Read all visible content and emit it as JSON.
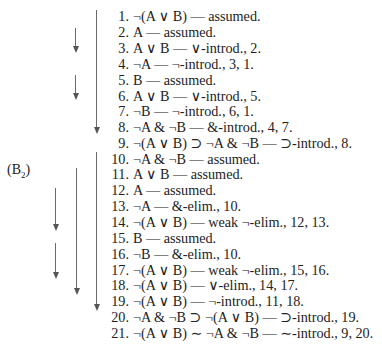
{
  "label": {
    "text": "(B",
    "sub": "2",
    "close": ")"
  },
  "lines": [
    {
      "n": "1.",
      "text": "¬(A ∨ B) — assumed."
    },
    {
      "n": "2.",
      "text": "A — assumed."
    },
    {
      "n": "3.",
      "text": "A ∨ B — ∨-introd., 2."
    },
    {
      "n": "4.",
      "text": "¬A — ¬-introd., 3, 1."
    },
    {
      "n": "5.",
      "text": "B — assumed."
    },
    {
      "n": "6.",
      "text": "A ∨ B — ∨-introd., 5."
    },
    {
      "n": "7.",
      "text": "¬B — ¬-introd., 6, 1."
    },
    {
      "n": "8.",
      "text": "¬A & ¬B — &-introd., 4, 7."
    },
    {
      "n": "9.",
      "text": "¬(A ∨ B) ⊃ ¬A & ¬B — ⊃-introd., 8."
    },
    {
      "n": "10.",
      "text": "¬A & ¬B — assumed."
    },
    {
      "n": "11.",
      "text": "A ∨ B — assumed."
    },
    {
      "n": "12.",
      "text": "A — assumed."
    },
    {
      "n": "13.",
      "text": "¬A — &-elim., 10."
    },
    {
      "n": "14.",
      "text": "¬(A ∨ B) — weak ¬-elim., 12, 13."
    },
    {
      "n": "15.",
      "text": "B — assumed."
    },
    {
      "n": "16.",
      "text": "¬B — &-elim., 10."
    },
    {
      "n": "17.",
      "text": "¬(A ∨ B) — weak ¬-elim., 15, 16."
    },
    {
      "n": "18.",
      "text": "¬(A ∨ B) — ∨-elim., 14, 17."
    },
    {
      "n": "19.",
      "text": "¬(A ∨ B) — ¬-introd., 11, 18."
    },
    {
      "n": "20.",
      "text": "¬A & ¬B ⊃ ¬(A ∨ B) — ⊃-introd., 19."
    },
    {
      "n": "21.",
      "text": "¬(A ∨ B) ∼ ¬A & ¬B — ∼-introd., 9, 20."
    }
  ]
}
